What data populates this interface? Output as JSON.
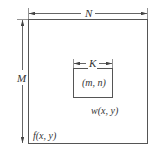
{
  "diagram": {
    "type": "image-filter-neighborhood",
    "colors": {
      "stroke": "#555555",
      "text": "#333333",
      "background": "#ffffff"
    },
    "labels": {
      "width_dim": "N",
      "height_dim": "M",
      "kernel_dim": "K",
      "center": "(m, n)",
      "kernel_fn": "w(x, y)",
      "image_fn": "f(x, y)"
    },
    "shapes": {
      "outer_rect": {
        "x": 28,
        "y": 19,
        "w": 119,
        "h": 124
      },
      "inner_rect": {
        "x": 73,
        "y": 68,
        "w": 39,
        "h": 29
      }
    }
  }
}
